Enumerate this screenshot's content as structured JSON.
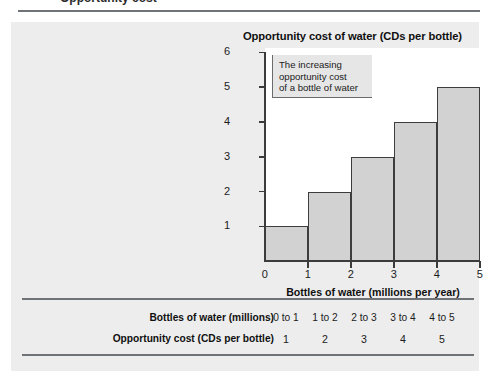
{
  "page": {
    "cropped_header_text": "Opportunity cost",
    "panel_bg": "#ededed",
    "rule_color": "#6f7276"
  },
  "chart_data": {
    "type": "bar",
    "title": "Opportunity cost of water (CDs per bottle)",
    "xlabel": "Bottles of water (millions per year)",
    "ylabel": "",
    "categories": [
      "0 to 1",
      "1 to 2",
      "2 to 3",
      "3 to 4",
      "4 to 5"
    ],
    "x": [
      0,
      1,
      2,
      3,
      4,
      5
    ],
    "values": [
      1,
      2,
      3,
      4,
      5
    ],
    "xlim": [
      0,
      5
    ],
    "ylim": [
      0,
      6
    ],
    "xticks": [
      "0",
      "1",
      "2",
      "3",
      "4",
      "5"
    ],
    "yticks": [
      "1",
      "2",
      "3",
      "4",
      "5",
      "6"
    ],
    "grid": false,
    "legend": "none",
    "bar_fill": "#d2d2d2",
    "bar_edge": "#3d3d3d",
    "annotation": {
      "line1": "The increasing",
      "line2": "opportunity cost",
      "line3": "of a bottle of water"
    }
  },
  "table": {
    "rows": [
      {
        "label": "Bottles of water (millions)",
        "cells": [
          "0 to 1",
          "1 to 2",
          "2 to 3",
          "3 to 4",
          "4 to 5"
        ]
      },
      {
        "label": "Opportunity cost (CDs per bottle)",
        "cells": [
          "1",
          "2",
          "3",
          "4",
          "5"
        ]
      }
    ]
  }
}
